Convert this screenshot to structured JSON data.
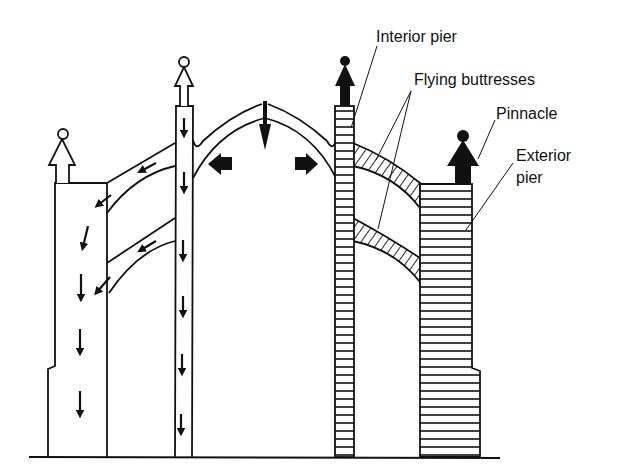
{
  "diagram": {
    "type": "cross-section",
    "colors": {
      "line": "#111111",
      "background": "#ffffff"
    },
    "labels": {
      "interior_pier": "Interior pier",
      "flying_buttresses": "Flying buttresses",
      "pinnacle": "Pinnacle",
      "exterior_pier_line1": "Exterior",
      "exterior_pier_line2": "pier"
    },
    "left_side": {
      "style": "outline with force arrows",
      "elements": [
        "pinnacle",
        "exterior pier",
        "flying buttresses",
        "interior column"
      ]
    },
    "right_side": {
      "style": "hatched masonry",
      "elements": [
        "pinnacle",
        "exterior pier",
        "flying buttresses",
        "interior pier"
      ]
    },
    "arch": {
      "thrust_arrows": [
        "down",
        "left",
        "right"
      ]
    }
  }
}
